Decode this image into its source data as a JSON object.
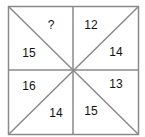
{
  "puzzle": {
    "line_color": "#8a8a8a",
    "cells": [
      {
        "position": "top-left-upper",
        "value": "?"
      },
      {
        "position": "top-left-lower",
        "value": "15"
      },
      {
        "position": "top-right-upper",
        "value": "12"
      },
      {
        "position": "top-right-lower",
        "value": "14"
      },
      {
        "position": "bottom-left-upper",
        "value": "16"
      },
      {
        "position": "bottom-left-lower",
        "value": "14"
      },
      {
        "position": "bottom-right-upper",
        "value": "13"
      },
      {
        "position": "bottom-right-lower",
        "value": "15"
      }
    ]
  }
}
